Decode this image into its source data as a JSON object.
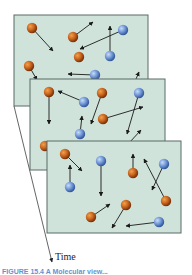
{
  "diagram": {
    "time_axis": {
      "label": "Time",
      "from": [
        14,
        106
      ],
      "to": [
        52,
        262
      ]
    },
    "caption": {
      "text": "FIGURE 15.4 A Molecular view..."
    },
    "colors": {
      "frame_fill": "#cfe3db",
      "frame_stroke": "#5a6a66",
      "orange_particle": "#c8641e",
      "blue_particle": "#6f96d6",
      "arrow": "#1a1a1a",
      "caption": "#3a78c8"
    },
    "frames": [
      {
        "name": "snapshot-1",
        "rect": [
          14,
          15,
          134,
          91
        ],
        "particles": [
          {
            "type": "orange",
            "x": 32,
            "y": 28,
            "arrow": [
              53,
              51
            ]
          },
          {
            "type": "orange",
            "x": 73,
            "y": 37,
            "arrow": [
              93,
              22
            ]
          },
          {
            "type": "blue",
            "x": 123,
            "y": 30,
            "arrow": [
              80,
              49
            ]
          },
          {
            "type": "blue",
            "x": 110,
            "y": 56,
            "arrow": [
              110,
              26
            ]
          },
          {
            "type": "orange",
            "x": 79,
            "y": 57,
            "arrow": null
          },
          {
            "type": "orange",
            "x": 29,
            "y": 66,
            "arrow": [
              37,
              80
            ]
          },
          {
            "type": "blue",
            "x": 95,
            "y": 75,
            "arrow": [
              68,
              74
            ]
          },
          {
            "type": "none",
            "x": 133,
            "y": 86,
            "arrow": [
              139,
              72
            ]
          }
        ]
      },
      {
        "name": "snapshot-2",
        "rect": [
          30,
          79,
          135,
          91
        ],
        "particles": [
          {
            "type": "orange",
            "x": 49,
            "y": 92,
            "arrow": [
              49,
              124
            ]
          },
          {
            "type": "blue",
            "x": 84,
            "y": 102,
            "arrow": [
              58,
              91
            ]
          },
          {
            "type": "orange",
            "x": 102,
            "y": 93,
            "arrow": [
              91,
              124
            ]
          },
          {
            "type": "blue",
            "x": 139,
            "y": 93,
            "arrow": [
              127,
              134
            ]
          },
          {
            "type": "orange",
            "x": 103,
            "y": 119,
            "arrow": [
              143,
              107
            ]
          },
          {
            "type": "blue",
            "x": 80,
            "y": 134,
            "arrow": [
              82,
              116
            ]
          },
          {
            "type": "orange",
            "x": 45,
            "y": 146,
            "arrow": null
          },
          {
            "type": "none",
            "x": 129,
            "y": 143,
            "arrow": [
              141,
              130
            ]
          }
        ]
      },
      {
        "name": "snapshot-3",
        "rect": [
          47,
          141,
          134,
          92
        ],
        "particles": [
          {
            "type": "orange",
            "x": 65,
            "y": 154,
            "arrow": [
              82,
              171
            ]
          },
          {
            "type": "blue",
            "x": 70,
            "y": 187,
            "arrow": [
              70,
              165
            ]
          },
          {
            "type": "blue",
            "x": 101,
            "y": 161,
            "arrow": [
              101,
              196
            ]
          },
          {
            "type": "orange",
            "x": 133,
            "y": 173,
            "arrow": [
              133,
              154
            ]
          },
          {
            "type": "blue",
            "x": 164,
            "y": 164,
            "arrow": [
              152,
              190
            ]
          },
          {
            "type": "orange",
            "x": 166,
            "y": 201,
            "arrow": [
              144,
              159
            ]
          },
          {
            "type": "orange",
            "x": 91,
            "y": 217,
            "arrow": [
              110,
              204
            ]
          },
          {
            "type": "orange",
            "x": 126,
            "y": 205,
            "arrow": [
              112,
              228
            ]
          },
          {
            "type": "blue",
            "x": 159,
            "y": 222,
            "arrow": [
              126,
              226
            ]
          }
        ]
      }
    ]
  }
}
